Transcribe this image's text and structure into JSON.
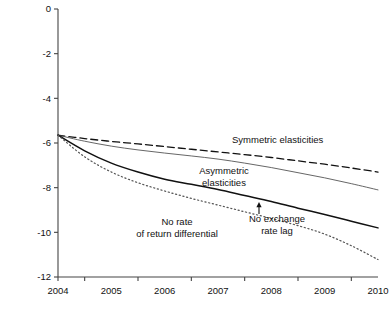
{
  "chart_data": {
    "type": "line",
    "title": "",
    "subtitle": "",
    "xlabel": "",
    "ylabel": "",
    "xlim": [
      2004,
      2010
    ],
    "ylim": [
      -12,
      0
    ],
    "grid": false,
    "legend_position": "inline-annotations",
    "x": [
      2004,
      2004.5,
      2005,
      2005.5,
      2006,
      2006.5,
      2007,
      2007.5,
      2008,
      2008.5,
      2009,
      2009.5,
      2010
    ],
    "yticks": [
      0,
      -2,
      -4,
      -6,
      -8,
      -10,
      -12
    ],
    "ytick_labels": [
      "0",
      "-2",
      "-4",
      "-6",
      "-8",
      "-10",
      "-12"
    ],
    "xticks": [
      2004,
      2005,
      2006,
      2007,
      2008,
      2009,
      2010
    ],
    "xtick_labels": [
      "2004",
      "2005",
      "2006",
      "2007",
      "2008",
      "2009",
      "2010"
    ],
    "series": [
      {
        "name": "Symmetric elasticities",
        "style": "dashed",
        "color": "#111111",
        "width": 1.3,
        "values": [
          -5.65,
          -5.8,
          -5.93,
          -6.04,
          -6.16,
          -6.28,
          -6.4,
          -6.52,
          -6.65,
          -6.8,
          -6.95,
          -7.12,
          -7.3
        ]
      },
      {
        "name": "Asymmetric elasticities",
        "style": "solid-thin",
        "color": "#555555",
        "width": 0.9,
        "values": [
          -5.65,
          -5.92,
          -6.14,
          -6.31,
          -6.45,
          -6.58,
          -6.72,
          -6.9,
          -7.1,
          -7.33,
          -7.56,
          -7.82,
          -8.1
        ]
      },
      {
        "name": "No exchange rate lag",
        "style": "solid-thick",
        "color": "#111111",
        "width": 1.5,
        "values": [
          -5.65,
          -6.35,
          -6.9,
          -7.3,
          -7.62,
          -7.85,
          -8.08,
          -8.35,
          -8.62,
          -8.92,
          -9.2,
          -9.5,
          -9.8
        ]
      },
      {
        "name": "No rate of return differential",
        "style": "dotted",
        "color": "#555555",
        "width": 1.2,
        "values": [
          -5.65,
          -6.62,
          -7.3,
          -7.78,
          -8.15,
          -8.48,
          -8.78,
          -9.08,
          -9.38,
          -9.7,
          -10.08,
          -10.6,
          -11.22
        ]
      }
    ],
    "annotations": [
      {
        "id": "symmetric-elasticities-label",
        "lines": [
          "Symmetric elasticities"
        ],
        "x": 232,
        "y": 143,
        "anchor": "start"
      },
      {
        "id": "asymmetric-elasticities-label",
        "lines": [
          "Asymmetric",
          "elasticities"
        ],
        "x": 224,
        "y": 174,
        "anchor": "middle"
      },
      {
        "id": "no-rate-of-return-differential-label",
        "lines": [
          "No rate",
          "of return differential"
        ],
        "x": 177,
        "y": 225,
        "anchor": "middle"
      },
      {
        "id": "no-exchange-rate-lag-label",
        "lines": [
          "No exchange",
          "rate lag"
        ],
        "x": 277,
        "y": 222,
        "anchor": "middle"
      }
    ],
    "arrow": {
      "id": "no-exchange-rate-lag-arrow",
      "from_x": 259,
      "from_y": 214,
      "to_x": 259,
      "to_y": 202
    }
  },
  "geometry": {
    "plot_left": 58,
    "plot_right": 378,
    "plot_top": 9,
    "plot_bottom": 277
  }
}
